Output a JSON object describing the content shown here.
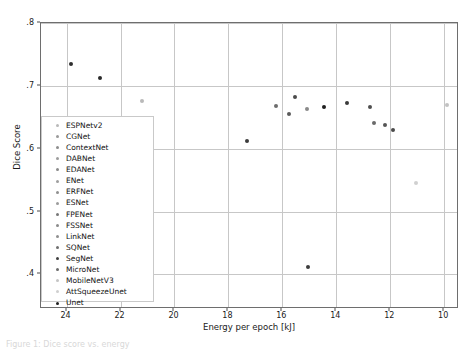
{
  "figure": {
    "caption_fragment": "Figure 1: Dice score vs. energy"
  },
  "chart_data": {
    "type": "scatter",
    "title": "",
    "xlabel": "Energy per epoch [kJ]",
    "ylabel": "Dice Score",
    "xlim": [
      24.95,
      9.45
    ],
    "ylim": [
      0.8,
      0.345
    ],
    "x_inverted": true,
    "xticks": [
      24,
      22,
      20,
      18,
      16,
      14,
      12,
      10
    ],
    "xtick_labels": [
      "24",
      "22",
      "20",
      "18",
      "16",
      "14",
      "12",
      "10"
    ],
    "yticks": [
      0.8,
      0.7,
      0.6,
      0.5,
      0.4
    ],
    "ytick_labels": [
      ".8",
      ".7",
      ".6",
      ".5",
      ".4"
    ],
    "grid": true,
    "legend_position": "lower left",
    "marker_size": 4,
    "series": [
      {
        "name": "ESPNetv2",
        "x": 21.2,
        "y": 0.676,
        "color": "#b9b9b9"
      },
      {
        "name": "CGNet",
        "x": 23.85,
        "y": 0.734,
        "color": "#2f2f2f"
      },
      {
        "name": "ContextNet",
        "x": 16.25,
        "y": 0.668,
        "color": "#6d6d6d"
      },
      {
        "name": "DABNet",
        "x": 15.55,
        "y": 0.683,
        "color": "#4b4b4b"
      },
      {
        "name": "EDANet",
        "x": 15.1,
        "y": 0.663,
        "color": "#8a8a8a"
      },
      {
        "name": "ENet",
        "x": 17.3,
        "y": 0.613,
        "color": "#3c3c3c"
      },
      {
        "name": "ERFNet",
        "x": 15.75,
        "y": 0.655,
        "color": "#5a5a5a"
      },
      {
        "name": "ESNet",
        "x": 13.6,
        "y": 0.672,
        "color": "#3a3a3a"
      },
      {
        "name": "FPENet",
        "x": 12.75,
        "y": 0.667,
        "color": "#4f4f4f"
      },
      {
        "name": "FSSNet",
        "x": 12.6,
        "y": 0.641,
        "color": "#6a6a6a"
      },
      {
        "name": "LinkNet",
        "x": 12.2,
        "y": 0.638,
        "color": "#555555"
      },
      {
        "name": "SQNet",
        "x": 11.9,
        "y": 0.629,
        "color": "#4a4a4a"
      },
      {
        "name": "SegNet",
        "x": 22.75,
        "y": 0.713,
        "color": "#2a2a2a"
      },
      {
        "name": "MicroNet",
        "x": 15.05,
        "y": 0.412,
        "color": "#3d3d3d"
      },
      {
        "name": "MobileNetV3",
        "x": 11.05,
        "y": 0.545,
        "color": "#d0d0d0"
      },
      {
        "name": "AttSqueezeUnet",
        "x": 9.9,
        "y": 0.669,
        "color": "#c2c2c2"
      },
      {
        "name": "Unet",
        "x": 14.45,
        "y": 0.667,
        "color": "#1f1f1f"
      }
    ],
    "legend_entries": [
      {
        "label": "ESPNetv2",
        "color": "#b9b9b9"
      },
      {
        "label": "CGNet",
        "color": "#9a9a9a"
      },
      {
        "label": "ContextNet",
        "color": "#8d8d8d"
      },
      {
        "label": "DABNet",
        "color": "#9d9d9d"
      },
      {
        "label": "EDANet",
        "color": "#8a8a8a"
      },
      {
        "label": "ENet",
        "color": "#9e9e9e"
      },
      {
        "label": "ERFNet",
        "color": "#8f8f8f"
      },
      {
        "label": "ESNet",
        "color": "#9c9c9c"
      },
      {
        "label": "FPENet",
        "color": "#777777"
      },
      {
        "label": "FSSNet",
        "color": "#8b8b8b"
      },
      {
        "label": "LinkNet",
        "color": "#8f8f8f"
      },
      {
        "label": "SQNet",
        "color": "#6f6f6f"
      },
      {
        "label": "SegNet",
        "color": "#3f3f3f"
      },
      {
        "label": "MicroNet",
        "color": "#6a6a6a"
      },
      {
        "label": "MobileNetV3",
        "color": "#c4c4c4"
      },
      {
        "label": "AttSqueezeUnet",
        "color": "#cfcfcf"
      },
      {
        "label": "Unet",
        "color": "#1f1f1f"
      }
    ]
  }
}
